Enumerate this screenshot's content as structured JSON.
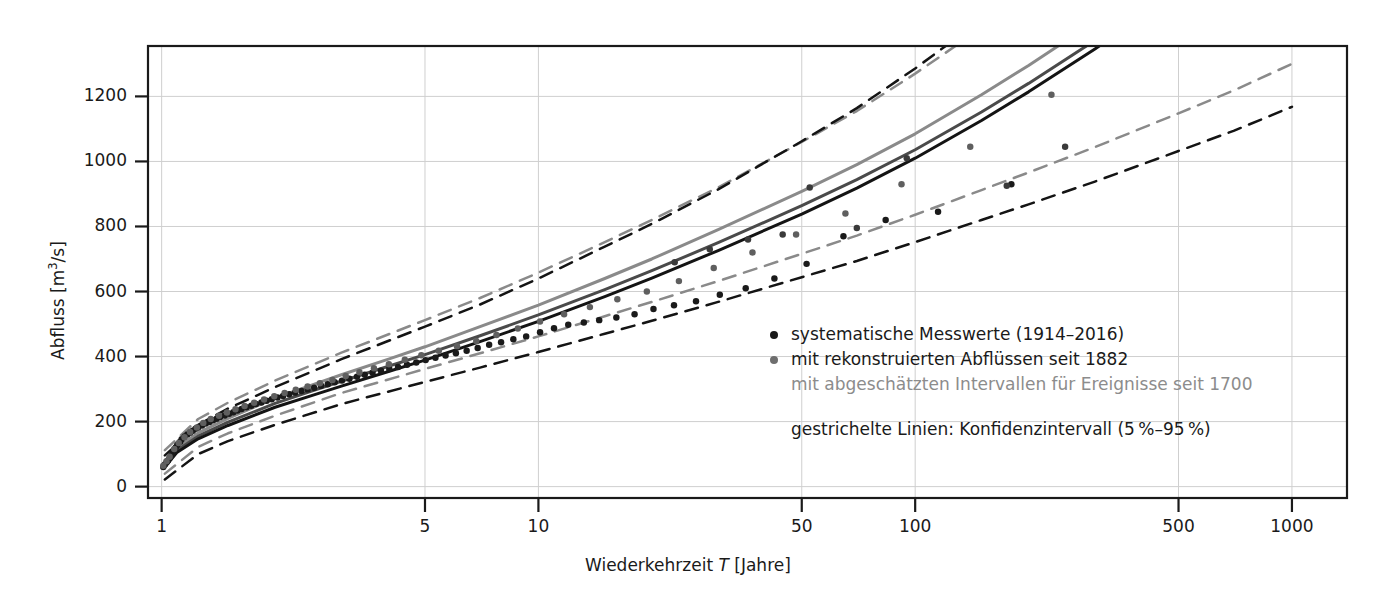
{
  "axes": {
    "y_title_prefix": "Abfluss [m",
    "y_title_sup": "3",
    "y_title_suffix": "/s]",
    "x_title_prefix": "Wiederkehrzeit ",
    "x_title_var": "T",
    "x_title_suffix": " [Jahre]"
  },
  "legend": {
    "entry_systematic": "systematische Messwerte (1914–2016)",
    "entry_reconstructed": "mit rekonstruierten Abflüssen seit 1882",
    "entry_estimated": "mit abgeschätzten Intervallen für Ereignisse seit 1700",
    "note_dashed": "gestrichelte Linien: Konfidenzintervall (5 %–9 5 %)",
    "note_dashed_display": "gestrichelte Linien: Konfidenzintervall (5 %–95 %)",
    "dot_black_color": "#1a1a1a",
    "dot_gray_color": "#6e6e6e",
    "text_gray_color": "#8c8c8c"
  },
  "colors": {
    "axis": "#1a1a1a",
    "grid": "#cfcfcf",
    "curve_upper_gray": "#8a8a8a",
    "curve_mid_dark": "#4a4a4a",
    "curve_lower_black": "#141414",
    "dash_gray": "#8a8a8a",
    "dash_black": "#141414",
    "point_black": "#1a1a1a",
    "point_gray": "#5f5f5f",
    "background": "#ffffff"
  },
  "chart_data": {
    "type": "line",
    "title": "",
    "subtitle": "",
    "xlabel": "Wiederkehrzeit T [Jahre]",
    "ylabel": "Abfluss [m3/s]",
    "xscale": "log",
    "yscale": "linear",
    "xlim": [
      0.92,
      1400
    ],
    "ylim": [
      -35,
      1355
    ],
    "grid": true,
    "legend_position": "inside-right-middle",
    "xticks": [
      1,
      5,
      10,
      50,
      100,
      500,
      1000
    ],
    "xtick_labels": [
      "1",
      "5",
      "10",
      "50",
      "100",
      "500",
      "1000"
    ],
    "yticks": [
      0,
      200,
      400,
      600,
      800,
      1000,
      1200
    ],
    "ytick_labels": [
      "0",
      "200",
      "400",
      "600",
      "800",
      "1000",
      "1200"
    ],
    "series": [
      {
        "name": "Anpassung mit rekonstruierten Abflüssen / Intervallen (oben, grau)",
        "style": "solid",
        "color": "#8a8a8a",
        "width": 3,
        "x": [
          1.02,
          1.1,
          1.25,
          1.5,
          2,
          2.5,
          3,
          4,
          5,
          7,
          10,
          15,
          20,
          30,
          50,
          70,
          100,
          150,
          200,
          300,
          500,
          700,
          1000
        ],
        "y": [
          70,
          120,
          165,
          210,
          272,
          312,
          344,
          392,
          430,
          492,
          558,
          640,
          700,
          790,
          908,
          990,
          1085,
          1205,
          1295,
          1430,
          1610,
          1730,
          1880
        ]
      },
      {
        "name": "Anpassung mittlere Kurve (dunkelgrau)",
        "style": "solid",
        "color": "#4a4a4a",
        "width": 3,
        "x": [
          1.02,
          1.1,
          1.25,
          1.5,
          2,
          2.5,
          3,
          4,
          5,
          7,
          10,
          15,
          20,
          30,
          50,
          70,
          100,
          150,
          200,
          300,
          500,
          700,
          1000
        ],
        "y": [
          65,
          112,
          155,
          198,
          256,
          294,
          324,
          370,
          406,
          464,
          528,
          606,
          664,
          750,
          864,
          944,
          1036,
          1152,
          1240,
          1372,
          1548,
          1665,
          1812
        ]
      },
      {
        "name": "Anpassung systematische Messwerte (schwarz)",
        "style": "solid",
        "color": "#141414",
        "width": 3,
        "x": [
          1.02,
          1.1,
          1.25,
          1.5,
          2,
          2.5,
          3,
          4,
          5,
          7,
          10,
          15,
          20,
          30,
          50,
          70,
          100,
          150,
          200,
          300,
          500,
          700,
          1000
        ],
        "y": [
          60,
          106,
          147,
          188,
          244,
          280,
          309,
          354,
          389,
          446,
          508,
          584,
          641,
          726,
          838,
          918,
          1010,
          1126,
          1214,
          1346,
          1522,
          1640,
          1788
        ]
      },
      {
        "name": "Konfidenzintervall 95 % (grau, gestrichelt)",
        "style": "dashed",
        "color": "#8a8a8a",
        "width": 2.5,
        "x": [
          1.02,
          1.25,
          1.5,
          2,
          3,
          5,
          7,
          10,
          15,
          20,
          30,
          50,
          70,
          100,
          150,
          200,
          300,
          500,
          700,
          1000
        ],
        "y": [
          112,
          208,
          258,
          326,
          412,
          512,
          580,
          658,
          752,
          820,
          920,
          1060,
          1155,
          1270,
          1410,
          1512,
          1665,
          1870,
          2005,
          2175
        ]
      },
      {
        "name": "Konfidenzintervall 95 % (schwarz, gestrichelt)",
        "style": "dashed",
        "color": "#141414",
        "width": 2.5,
        "x": [
          1.02,
          1.25,
          1.5,
          2,
          3,
          5,
          7,
          10,
          15,
          20,
          30,
          50,
          70,
          100,
          150,
          200,
          300,
          500,
          700,
          1000
        ],
        "y": [
          96,
          190,
          240,
          306,
          392,
          492,
          560,
          640,
          738,
          808,
          914,
          1062,
          1164,
          1286,
          1436,
          1546,
          1712,
          1934,
          2080,
          2266
        ]
      },
      {
        "name": "Konfidenzintervall 5 % (grau, gestrichelt)",
        "style": "dashed",
        "color": "#8a8a8a",
        "width": 2.5,
        "x": [
          1.02,
          1.25,
          1.5,
          2,
          3,
          5,
          7,
          10,
          15,
          20,
          30,
          50,
          70,
          100,
          150,
          200,
          300,
          500,
          700,
          1000
        ],
        "y": [
          40,
          122,
          164,
          218,
          288,
          362,
          410,
          462,
          524,
          568,
          632,
          716,
          772,
          836,
          912,
          966,
          1044,
          1148,
          1218,
          1300
        ]
      },
      {
        "name": "Konfidenzintervall 5 % (schwarz, gestrichelt)",
        "style": "dashed",
        "color": "#141414",
        "width": 2.5,
        "x": [
          1.02,
          1.25,
          1.5,
          2,
          3,
          5,
          7,
          10,
          15,
          20,
          30,
          50,
          70,
          100,
          150,
          200,
          300,
          500,
          700,
          1000
        ],
        "y": [
          22,
          100,
          140,
          190,
          254,
          322,
          366,
          414,
          470,
          510,
          568,
          644,
          694,
          752,
          820,
          868,
          938,
          1032,
          1094,
          1168
        ]
      }
    ],
    "scatter": [
      {
        "name": "systematische Messwerte (1914–2016)",
        "marker": "circle",
        "color": "#1a1a1a",
        "size": 5,
        "points": [
          [
            1.01,
            60
          ],
          [
            1.02,
            68
          ],
          [
            1.03,
            74
          ],
          [
            1.04,
            80
          ],
          [
            1.05,
            88
          ],
          [
            1.06,
            96
          ],
          [
            1.07,
            104
          ],
          [
            1.08,
            112
          ],
          [
            1.09,
            120
          ],
          [
            1.1,
            128
          ],
          [
            1.12,
            138
          ],
          [
            1.13,
            146
          ],
          [
            1.15,
            154
          ],
          [
            1.17,
            160
          ],
          [
            1.19,
            166
          ],
          [
            1.21,
            172
          ],
          [
            1.23,
            178
          ],
          [
            1.25,
            182
          ],
          [
            1.28,
            188
          ],
          [
            1.31,
            194
          ],
          [
            1.34,
            199
          ],
          [
            1.37,
            204
          ],
          [
            1.4,
            209
          ],
          [
            1.43,
            214
          ],
          [
            1.47,
            219
          ],
          [
            1.51,
            224
          ],
          [
            1.55,
            229
          ],
          [
            1.59,
            234
          ],
          [
            1.63,
            239
          ],
          [
            1.68,
            244
          ],
          [
            1.73,
            249
          ],
          [
            1.78,
            254
          ],
          [
            1.84,
            259
          ],
          [
            1.9,
            264
          ],
          [
            1.96,
            269
          ],
          [
            2.03,
            274
          ],
          [
            2.1,
            279
          ],
          [
            2.18,
            284
          ],
          [
            2.26,
            289
          ],
          [
            2.35,
            294
          ],
          [
            2.44,
            299
          ],
          [
            2.54,
            304
          ],
          [
            2.65,
            310
          ],
          [
            2.76,
            315
          ],
          [
            2.88,
            321
          ],
          [
            3.01,
            326
          ],
          [
            3.15,
            332
          ],
          [
            3.3,
            338
          ],
          [
            3.46,
            344
          ],
          [
            3.63,
            350
          ],
          [
            3.82,
            356
          ],
          [
            4.02,
            362
          ],
          [
            4.24,
            368
          ],
          [
            4.48,
            375
          ],
          [
            4.74,
            382
          ],
          [
            5.02,
            389
          ],
          [
            5.33,
            396
          ],
          [
            5.67,
            403
          ],
          [
            6.04,
            410
          ],
          [
            6.45,
            418
          ],
          [
            6.9,
            426
          ],
          [
            7.4,
            436
          ],
          [
            7.96,
            444
          ],
          [
            8.58,
            453
          ],
          [
            9.28,
            462
          ],
          [
            10.1,
            475
          ],
          [
            11.0,
            487
          ],
          [
            12.0,
            498
          ],
          [
            13.2,
            505
          ],
          [
            14.5,
            512
          ],
          [
            16.1,
            520
          ],
          [
            18.0,
            530
          ],
          [
            20.2,
            546
          ],
          [
            22.9,
            558
          ],
          [
            26.2,
            570
          ],
          [
            30.3,
            590
          ],
          [
            35.5,
            610
          ],
          [
            42.3,
            640
          ],
          [
            51.5,
            685
          ],
          [
            64.5,
            770
          ],
          [
            83.5,
            820
          ],
          [
            115,
            845
          ],
          [
            180,
            930
          ]
        ]
      },
      {
        "name": "mit rekonstruierten Abflüssen seit 1882",
        "marker": "circle",
        "color": "#5f5f5f",
        "size": 5,
        "points": [
          [
            1.01,
            64
          ],
          [
            1.03,
            78
          ],
          [
            1.05,
            92
          ],
          [
            1.08,
            116
          ],
          [
            1.11,
            134
          ],
          [
            1.15,
            152
          ],
          [
            1.19,
            168
          ],
          [
            1.24,
            182
          ],
          [
            1.29,
            196
          ],
          [
            1.35,
            208
          ],
          [
            1.42,
            218
          ],
          [
            1.49,
            228
          ],
          [
            1.57,
            238
          ],
          [
            1.66,
            248
          ],
          [
            1.76,
            258
          ],
          [
            1.87,
            268
          ],
          [
            1.99,
            278
          ],
          [
            2.12,
            288
          ],
          [
            2.27,
            298
          ],
          [
            2.44,
            308
          ],
          [
            2.63,
            318
          ],
          [
            2.84,
            328
          ],
          [
            3.08,
            340
          ],
          [
            3.35,
            352
          ],
          [
            3.66,
            364
          ],
          [
            4.01,
            376
          ],
          [
            4.42,
            390
          ],
          [
            4.89,
            404
          ],
          [
            5.44,
            418
          ],
          [
            6.08,
            432
          ],
          [
            6.84,
            448
          ],
          [
            7.74,
            466
          ],
          [
            8.82,
            486
          ],
          [
            10.1,
            508
          ],
          [
            11.7,
            530
          ],
          [
            13.7,
            552
          ],
          [
            16.2,
            576
          ],
          [
            19.4,
            600
          ],
          [
            23.6,
            632
          ],
          [
            29.2,
            672
          ],
          [
            37.0,
            720
          ],
          [
            48.3,
            775
          ],
          [
            65.3,
            840
          ],
          [
            92.0,
            930
          ],
          [
            140,
            1045
          ],
          [
            230,
            1205
          ]
        ]
      },
      {
        "name": "vereinzelte obere Ereignisse (dunkel)",
        "marker": "circle",
        "color": "#3a3a3a",
        "size": 5,
        "points": [
          [
            23.0,
            690
          ],
          [
            28.5,
            730
          ],
          [
            36.0,
            760
          ],
          [
            44.5,
            775
          ],
          [
            52.5,
            920
          ],
          [
            70.0,
            795
          ],
          [
            95.0,
            1010
          ],
          [
            175,
            925
          ],
          [
            250,
            1045
          ]
        ]
      }
    ]
  }
}
